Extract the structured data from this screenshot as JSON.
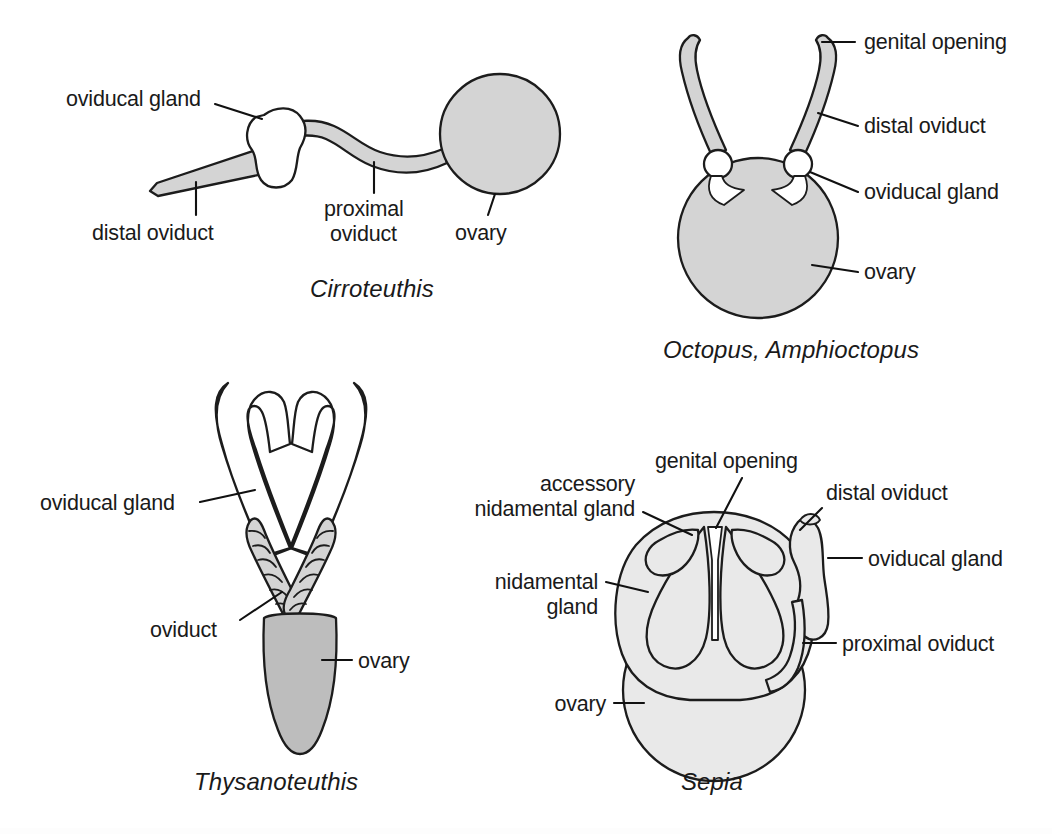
{
  "figure": {
    "background_color": "#ffffff",
    "ink_color": "#1a1a1a",
    "organ_fill_gray": "#d4d4d4",
    "organ_fill_light": "#e9e9e9",
    "organ_fill_white": "#ffffff"
  },
  "panels": [
    {
      "id": "cirroteuthis",
      "caption": "Cirroteuthis",
      "labels": [
        {
          "key": "oviducal_gland",
          "text": "oviducal gland"
        },
        {
          "key": "distal_oviduct",
          "text": "distal oviduct"
        },
        {
          "key": "proximal_oviduct_line1",
          "text": "proximal"
        },
        {
          "key": "proximal_oviduct_line2",
          "text": "oviduct"
        },
        {
          "key": "ovary",
          "text": "ovary"
        }
      ]
    },
    {
      "id": "octopus",
      "caption": "Octopus, Amphioctopus",
      "labels": [
        {
          "key": "genital_opening",
          "text": "genital opening"
        },
        {
          "key": "distal_oviduct",
          "text": "distal oviduct"
        },
        {
          "key": "oviducal_gland",
          "text": "oviducal gland"
        },
        {
          "key": "ovary",
          "text": "ovary"
        }
      ]
    },
    {
      "id": "thysanoteuthis",
      "caption": "Thysanoteuthis",
      "labels": [
        {
          "key": "oviducal_gland",
          "text": "oviducal gland"
        },
        {
          "key": "oviduct",
          "text": "oviduct"
        },
        {
          "key": "ovary",
          "text": "ovary"
        }
      ]
    },
    {
      "id": "sepia",
      "caption": "Sepia",
      "labels": [
        {
          "key": "accessory_nidamental_gland_line1",
          "text": "accessory"
        },
        {
          "key": "accessory_nidamental_gland_line2",
          "text": "nidamental gland"
        },
        {
          "key": "genital_opening",
          "text": "genital opening"
        },
        {
          "key": "distal_oviduct",
          "text": "distal oviduct"
        },
        {
          "key": "nidamental_gland_line1",
          "text": "nidamental"
        },
        {
          "key": "nidamental_gland_line2",
          "text": "gland"
        },
        {
          "key": "oviducal_gland",
          "text": "oviducal gland"
        },
        {
          "key": "proximal_oviduct",
          "text": "proximal oviduct"
        },
        {
          "key": "ovary",
          "text": "ovary"
        }
      ]
    }
  ]
}
